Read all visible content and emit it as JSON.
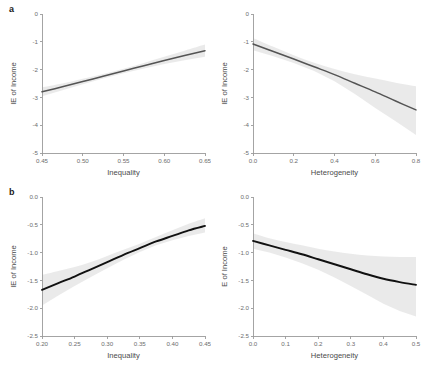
{
  "figure": {
    "panel_labels": [
      "a",
      "b"
    ],
    "background": "#ffffff",
    "line_color_row_a": "#545454",
    "line_color_row_b": "#111111",
    "band_color": "#d9d9d9"
  },
  "chart_data": [
    {
      "id": "a-left",
      "panel": "a",
      "type": "line",
      "title": "",
      "xlabel": "Inequality",
      "ylabel": "IE of Income",
      "xlim": [
        0.45,
        0.65
      ],
      "ylim": [
        -5,
        0
      ],
      "xticks": [
        0.45,
        0.5,
        0.55,
        0.6,
        0.65
      ],
      "xticklabels": [
        "0.45",
        "0.50",
        "0.55",
        "0.60",
        "0.65"
      ],
      "yticks": [
        0,
        -1,
        -2,
        -3,
        -4,
        -5
      ],
      "yticklabels": [
        "0",
        "-1",
        "-2",
        "-3",
        "-4",
        "-5"
      ],
      "grid": false,
      "legend": "none",
      "series": [
        {
          "name": "fit",
          "x": [
            0.45,
            0.475,
            0.5,
            0.525,
            0.55,
            0.575,
            0.6,
            0.625,
            0.65
          ],
          "values": [
            -2.8,
            -2.62,
            -2.43,
            -2.24,
            -2.05,
            -1.86,
            -1.67,
            -1.49,
            -1.32
          ]
        }
      ],
      "confidence_band": {
        "x": [
          0.45,
          0.475,
          0.5,
          0.525,
          0.55,
          0.575,
          0.6,
          0.625,
          0.65
        ],
        "lower": [
          -2.96,
          -2.74,
          -2.53,
          -2.32,
          -2.13,
          -1.96,
          -1.8,
          -1.66,
          -1.54
        ],
        "upper": [
          -2.64,
          -2.5,
          -2.33,
          -2.16,
          -1.97,
          -1.76,
          -1.54,
          -1.32,
          -1.1
        ]
      }
    },
    {
      "id": "a-right",
      "panel": "a",
      "type": "line",
      "title": "",
      "xlabel": "Heterogeneity",
      "ylabel": "IE of Income",
      "xlim": [
        0.0,
        0.8
      ],
      "ylim": [
        -5,
        0
      ],
      "xticks": [
        0.0,
        0.2,
        0.4,
        0.6,
        0.8
      ],
      "xticklabels": [
        "0.0",
        "0.2",
        "0.4",
        "0.6",
        "0.8"
      ],
      "yticks": [
        0,
        -1,
        -2,
        -3,
        -4,
        -5
      ],
      "yticklabels": [
        "0",
        "-1",
        "-2",
        "-3",
        "-4",
        "-5"
      ],
      "grid": false,
      "legend": "none",
      "series": [
        {
          "name": "fit",
          "x": [
            0.0,
            0.1,
            0.2,
            0.3,
            0.4,
            0.5,
            0.6,
            0.7,
            0.8
          ],
          "values": [
            -1.08,
            -1.35,
            -1.62,
            -1.9,
            -2.18,
            -2.49,
            -2.8,
            -3.13,
            -3.45
          ]
        }
      ],
      "confidence_band": {
        "x": [
          0.0,
          0.1,
          0.2,
          0.3,
          0.4,
          0.5,
          0.6,
          0.7,
          0.8
        ],
        "lower": [
          -1.3,
          -1.52,
          -1.76,
          -2.05,
          -2.42,
          -2.88,
          -3.38,
          -3.86,
          -4.35
        ],
        "upper": [
          -0.86,
          -1.18,
          -1.48,
          -1.75,
          -1.98,
          -2.17,
          -2.32,
          -2.47,
          -2.6
        ]
      }
    },
    {
      "id": "b-left",
      "panel": "b",
      "type": "line",
      "title": "",
      "xlabel": "Inequality",
      "ylabel": "IE of Income",
      "xlim": [
        0.2,
        0.45
      ],
      "ylim": [
        -2.5,
        0.0
      ],
      "xticks": [
        0.2,
        0.25,
        0.3,
        0.35,
        0.4,
        0.45
      ],
      "xticklabels": [
        "0.20",
        "0.25",
        "0.30",
        "0.35",
        "0.40",
        "0.45"
      ],
      "yticks": [
        0.0,
        -0.5,
        -1.0,
        -1.5,
        -2.0,
        -2.5
      ],
      "yticklabels": [
        "0.0",
        "-0.5",
        "-1.0",
        "-1.5",
        "-2.0",
        "-2.5"
      ],
      "grid": false,
      "legend": "none",
      "series": [
        {
          "name": "fit",
          "x": [
            0.2,
            0.225,
            0.25,
            0.275,
            0.3,
            0.325,
            0.35,
            0.375,
            0.4,
            0.425,
            0.45
          ],
          "values": [
            -1.67,
            -1.55,
            -1.43,
            -1.3,
            -1.17,
            -1.04,
            -0.92,
            -0.8,
            -0.7,
            -0.6,
            -0.52
          ]
        }
      ],
      "confidence_band": {
        "x": [
          0.2,
          0.225,
          0.25,
          0.275,
          0.3,
          0.325,
          0.35,
          0.375,
          0.4,
          0.425,
          0.45
        ],
        "lower": [
          -1.95,
          -1.77,
          -1.6,
          -1.44,
          -1.28,
          -1.13,
          -0.99,
          -0.87,
          -0.78,
          -0.7,
          -0.64
        ],
        "upper": [
          -1.4,
          -1.33,
          -1.26,
          -1.17,
          -1.06,
          -0.95,
          -0.84,
          -0.72,
          -0.6,
          -0.48,
          -0.38
        ]
      }
    },
    {
      "id": "b-right",
      "panel": "b",
      "type": "line",
      "title": "",
      "xlabel": "Heterogeneity",
      "ylabel": "E of Income",
      "xlim": [
        0.0,
        0.5
      ],
      "ylim": [
        -2.5,
        0.0
      ],
      "xticks": [
        0.0,
        0.1,
        0.2,
        0.3,
        0.4,
        0.5
      ],
      "xticklabels": [
        "0.0",
        "0.1",
        "0.2",
        "0.3",
        "0.4",
        "0.5"
      ],
      "yticks": [
        0.0,
        -0.5,
        -1.0,
        -1.5,
        -2.0,
        -2.5
      ],
      "yticklabels": [
        "0.0",
        "-0.5",
        "-1.0",
        "-1.5",
        "-2.0",
        "-2.5"
      ],
      "grid": false,
      "legend": "none",
      "series": [
        {
          "name": "fit",
          "x": [
            0.0,
            0.05,
            0.1,
            0.15,
            0.2,
            0.25,
            0.3,
            0.35,
            0.4,
            0.45,
            0.5
          ],
          "values": [
            -0.79,
            -0.87,
            -0.95,
            -1.03,
            -1.12,
            -1.21,
            -1.3,
            -1.39,
            -1.47,
            -1.53,
            -1.58
          ]
        }
      ],
      "confidence_band": {
        "x": [
          0.0,
          0.05,
          0.1,
          0.15,
          0.2,
          0.25,
          0.3,
          0.35,
          0.4,
          0.45,
          0.5
        ],
        "lower": [
          -0.93,
          -1.0,
          -1.09,
          -1.19,
          -1.31,
          -1.45,
          -1.6,
          -1.76,
          -1.92,
          -2.05,
          -2.15
        ],
        "upper": [
          -0.65,
          -0.74,
          -0.81,
          -0.87,
          -0.93,
          -0.98,
          -1.02,
          -1.05,
          -1.07,
          -1.08,
          -1.08
        ]
      }
    }
  ]
}
